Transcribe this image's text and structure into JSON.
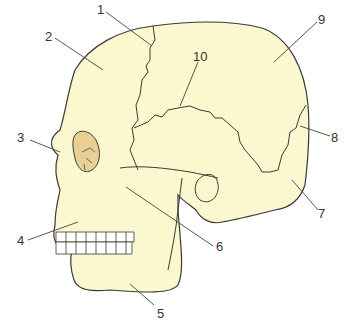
{
  "diagram": {
    "colors": {
      "bone": "#fbf7cf",
      "outline": "#3a3a36",
      "orbit": "#e8cf94",
      "leader": "#444444"
    },
    "labels": [
      {
        "id": "1",
        "text": "1",
        "x": 97,
        "y": 3
      },
      {
        "id": "2",
        "text": "2",
        "x": 45,
        "y": 30
      },
      {
        "id": "3",
        "text": "3",
        "x": 17,
        "y": 131
      },
      {
        "id": "4",
        "text": "4",
        "x": 17,
        "y": 234
      },
      {
        "id": "5",
        "text": "5",
        "x": 157,
        "y": 307
      },
      {
        "id": "6",
        "text": "6",
        "x": 216,
        "y": 240
      },
      {
        "id": "7",
        "text": "7",
        "x": 318,
        "y": 207
      },
      {
        "id": "8",
        "text": "8",
        "x": 331,
        "y": 131
      },
      {
        "id": "9",
        "text": "9",
        "x": 318,
        "y": 13
      },
      {
        "id": "10",
        "text": "10",
        "x": 193,
        "y": 50
      }
    ]
  }
}
